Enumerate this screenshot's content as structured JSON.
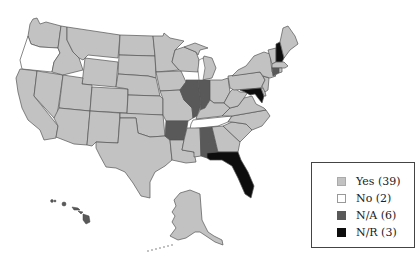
{
  "map": {
    "region": "United States",
    "colors": {
      "yes": "#c2c2c2",
      "no": "#ffffff",
      "na": "#595959",
      "nr": "#0d0d0d",
      "water": "#ffffff",
      "border": "#555555"
    },
    "categories": {
      "no": [
        "Oregon",
        "Tennessee"
      ],
      "na": [
        "Illinois",
        "Indiana",
        "Arkansas",
        "Alabama",
        "Hawaii",
        "Connecticut"
      ],
      "nr": [
        "New Hampshire",
        "Maryland",
        "Florida"
      ]
    }
  },
  "legend": {
    "items": [
      {
        "key": "yes",
        "label": "Yes (39)",
        "color": "#c2c2c2"
      },
      {
        "key": "no",
        "label": "No (2)",
        "color": "#ffffff"
      },
      {
        "key": "na",
        "label": "N/A (6)",
        "color": "#595959"
      },
      {
        "key": "nr",
        "label": "N/R (3)",
        "color": "#0d0d0d"
      }
    ]
  }
}
